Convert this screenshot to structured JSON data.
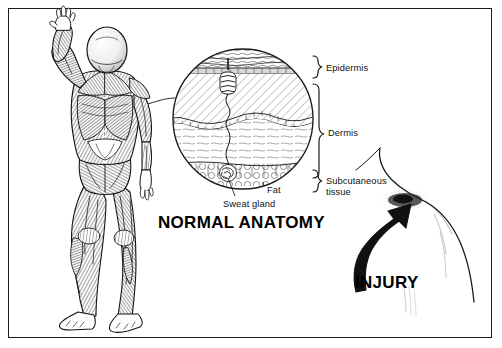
{
  "figure": {
    "background_color": "#ffffff",
    "ink_color": "#111111",
    "border_color": "#1a1a1a"
  },
  "captions": {
    "normal": "NORMAL ANATOMY",
    "injury": "INJURY"
  },
  "labels": {
    "epidermis": "Epidermis",
    "dermis": "Dermis",
    "subcutaneous": "Subcutaneous\ntissue",
    "fat": "Fat",
    "sweat_gland": "Sweat gland"
  },
  "panels": {
    "left": {
      "name": "posterior-muscular-figure",
      "description": "Back view of human male figure with surface musculature, left arm raised overhead"
    },
    "center": {
      "name": "skin-cross-section-magnifier",
      "description": "Circular magnified cross-section of skin showing epidermis, dermis, subcutaneous fat and a sweat gland",
      "layers": [
        "Epidermis",
        "Dermis",
        "Subcutaneous tissue"
      ],
      "structures": [
        "Sweat gland",
        "Fat"
      ]
    },
    "right": {
      "name": "injury-shoulder-outline",
      "description": "Line outline of neck and shoulder with a dark stippled contusion, indicated by a curved arrow"
    }
  }
}
